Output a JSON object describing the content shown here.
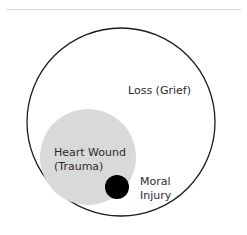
{
  "diagram": {
    "outer": {
      "label": "Loss (Grief)",
      "stroke": "#1a1a1a",
      "fill": "#ffffff"
    },
    "middle": {
      "label_line1": "Heart Wound",
      "label_line2": "(Trauma)",
      "fill": "#d9d9d9"
    },
    "inner": {
      "label_line1": "Moral",
      "label_line2": "Injury",
      "fill": "#000000"
    }
  }
}
